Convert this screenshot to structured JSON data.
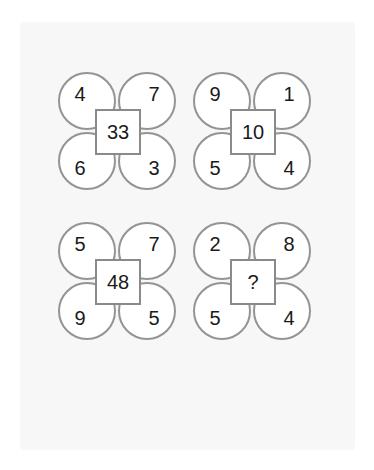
{
  "panel": {
    "background_color": "#f7f7f7"
  },
  "colors": {
    "petal_stroke": "#949494",
    "square_stroke": "#8a8a8a",
    "shape_fill": "#ffffff",
    "text": "#1a1a1a",
    "page_background": "#ffffff"
  },
  "puzzle": {
    "type": "four-petal-flower-number-puzzle",
    "unknown_marker": "?",
    "groups": [
      {
        "position": "top-left",
        "petals": {
          "top_left": "4",
          "top_right": "7",
          "bottom_left": "6",
          "bottom_right": "3"
        },
        "center": "33"
      },
      {
        "position": "top-right",
        "petals": {
          "top_left": "9",
          "top_right": "1",
          "bottom_left": "5",
          "bottom_right": "4"
        },
        "center": "10"
      },
      {
        "position": "bottom-left",
        "petals": {
          "top_left": "5",
          "top_right": "7",
          "bottom_left": "9",
          "bottom_right": "5"
        },
        "center": "48"
      },
      {
        "position": "bottom-right",
        "petals": {
          "top_left": "2",
          "top_right": "8",
          "bottom_left": "5",
          "bottom_right": "4"
        },
        "center": "?"
      }
    ]
  }
}
